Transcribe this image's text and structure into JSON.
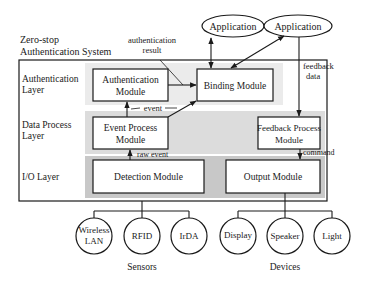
{
  "system": {
    "title_line1": "Zero-stop",
    "title_line2": "Authentication System"
  },
  "layers": [
    {
      "id": "auth",
      "line1": "Authentication",
      "line2": "Layer",
      "color": "#ebebeb"
    },
    {
      "id": "data",
      "line1": "Data Process",
      "line2": "Layer",
      "color": "#dcdcdc"
    },
    {
      "id": "io",
      "line1": "I/O Layer",
      "line2": "",
      "color": "#c8c8c8"
    }
  ],
  "modules": {
    "authentication": {
      "line1": "Authentication",
      "line2": "Module"
    },
    "binding": {
      "line1": "Binding Module"
    },
    "event_process": {
      "line1": "Event Process",
      "line2": "Module"
    },
    "feedback_process": {
      "line1": "Feedback Process",
      "line2": "Module"
    },
    "detection": {
      "line1": "Detection Module"
    },
    "output": {
      "line1": "Output Module"
    }
  },
  "applications": [
    {
      "label": "Application"
    },
    {
      "label": "Application"
    }
  ],
  "edge_labels": {
    "auth_result_line1": "authentication",
    "auth_result_line2": "result",
    "event": "event",
    "raw_event": "raw event",
    "feedback_line1": "feedback",
    "feedback_line2": "data",
    "command": "command"
  },
  "sensors": {
    "group_label": "Sensors",
    "items": [
      {
        "line1": "Wireless",
        "line2": "LAN"
      },
      {
        "line1": "RFID",
        "line2": ""
      },
      {
        "line1": "IrDA",
        "line2": ""
      }
    ]
  },
  "devices": {
    "group_label": "Devices",
    "items": [
      {
        "line1": "Display",
        "line2": ""
      },
      {
        "line1": "Speaker",
        "line2": ""
      },
      {
        "line1": "Light",
        "line2": ""
      }
    ]
  }
}
